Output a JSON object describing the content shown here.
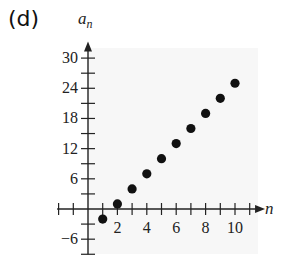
{
  "panel_label": "(d)",
  "chart_data": {
    "type": "scatter",
    "title": "",
    "xlabel": "n",
    "ylabel": "a_n",
    "x": [
      1,
      2,
      3,
      4,
      5,
      6,
      7,
      8,
      9,
      10
    ],
    "series": [
      {
        "name": "a_n",
        "values": [
          -2,
          1,
          4,
          7,
          10,
          13,
          16,
          19,
          22,
          25
        ]
      }
    ],
    "x_ticks": [
      2,
      4,
      6,
      8,
      10
    ],
    "y_ticks": [
      -6,
      6,
      12,
      18,
      24,
      30
    ],
    "xlim": [
      -2,
      11
    ],
    "ylim": [
      -9,
      32
    ],
    "grid": false,
    "legend": "none",
    "marker_color": "#111111",
    "plot_background": "#f7f7f7"
  },
  "axes": {
    "x_name": "n",
    "y_name": "a",
    "y_name_sub": "n",
    "x_tick_labels": [
      "2",
      "4",
      "6",
      "8",
      "10"
    ],
    "y_tick_labels": [
      "30",
      "24",
      "18",
      "12",
      "6",
      "−6"
    ]
  }
}
